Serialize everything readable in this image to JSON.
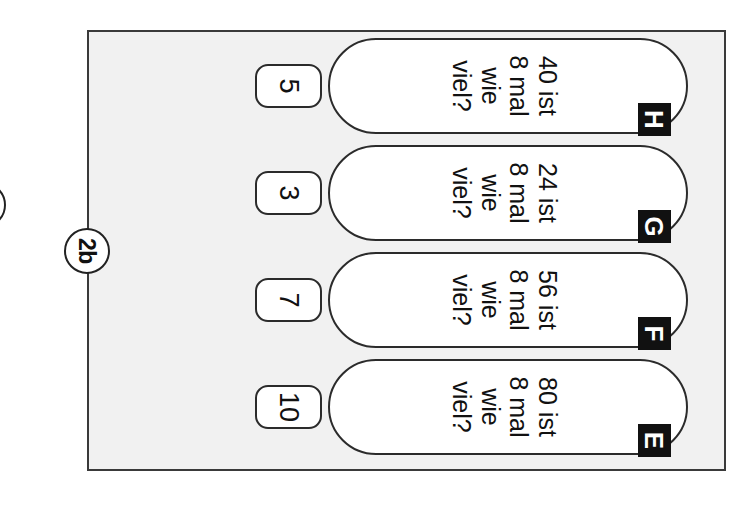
{
  "page": {
    "background_color": "#ffffff",
    "panel_background_color": "#f1f1f1",
    "border_color": "#3a3a3a",
    "badge_color": "#111111",
    "orientation": "rotated-90",
    "language": "de"
  },
  "exercise": {
    "number_label": "2b",
    "partial_previous_label": ""
  },
  "tasks": [
    {
      "letter": "H",
      "question": "40 ist\n8 mal\nwie viel?",
      "answer": "5"
    },
    {
      "letter": "G",
      "question": "24 ist\n8 mal\nwie viel?",
      "answer": "3"
    },
    {
      "letter": "F",
      "question": "56 ist\n8 mal\nwie viel?",
      "answer": "7"
    },
    {
      "letter": "E",
      "question": "80 ist\n8 mal\nwie viel?",
      "answer": "10"
    }
  ]
}
